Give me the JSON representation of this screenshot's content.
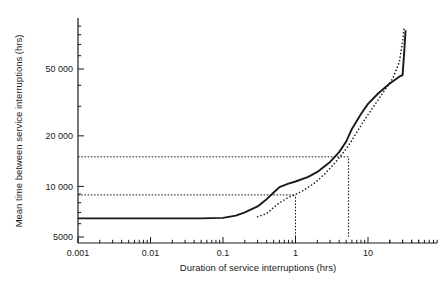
{
  "chart_data": {
    "type": "line",
    "title": "",
    "xlabel": "Duration of service interruptions (hrs)",
    "ylabel": "Mean time between service interruptions (hrs)",
    "xscale": "log",
    "yscale": "log",
    "xlim": [
      0.001,
      50
    ],
    "ylim": [
      5000,
      90000
    ],
    "xticks": [
      0.001,
      0.01,
      0.1,
      1,
      10
    ],
    "xticklabels": [
      "0.001",
      "0.01",
      "0.1",
      "1",
      "10"
    ],
    "yticks": [
      5000,
      10000,
      20000,
      50000
    ],
    "yticklabels": [
      "5000",
      "10 000",
      "20 000",
      "50 000"
    ],
    "grid": false,
    "legend": "none",
    "series": [
      {
        "name": "solid-curve",
        "style": "solid",
        "color": "#1a1a1a",
        "points": [
          [
            0.001,
            6450
          ],
          [
            0.01,
            6450
          ],
          [
            0.05,
            6450
          ],
          [
            0.1,
            6500
          ],
          [
            0.15,
            6700
          ],
          [
            0.2,
            7000
          ],
          [
            0.3,
            7600
          ],
          [
            0.4,
            8400
          ],
          [
            0.5,
            9200
          ],
          [
            0.6,
            9900
          ],
          [
            0.8,
            10400
          ],
          [
            1.0,
            10700
          ],
          [
            1.5,
            11400
          ],
          [
            2.0,
            12200
          ],
          [
            3.0,
            14000
          ],
          [
            4.0,
            16000
          ],
          [
            5.0,
            18500
          ],
          [
            6.0,
            22000
          ],
          [
            8.0,
            27000
          ],
          [
            10.0,
            31000
          ],
          [
            14.0,
            36000
          ],
          [
            20.0,
            41000
          ],
          [
            27.0,
            45000
          ],
          [
            30.0,
            46000
          ],
          [
            31.5,
            62000
          ],
          [
            33.0,
            85000
          ]
        ]
      },
      {
        "name": "dotted-curve",
        "style": "dotted",
        "color": "#1a1a1a",
        "points": [
          [
            0.3,
            6600
          ],
          [
            0.4,
            6900
          ],
          [
            0.5,
            7500
          ],
          [
            0.6,
            8000
          ],
          [
            0.8,
            8600
          ],
          [
            1.0,
            8950
          ],
          [
            1.3,
            9500
          ],
          [
            1.8,
            10400
          ],
          [
            2.5,
            11800
          ],
          [
            3.5,
            13800
          ],
          [
            4.5,
            15800
          ],
          [
            5.4,
            17500
          ],
          [
            7.0,
            21000
          ],
          [
            9.0,
            25000
          ],
          [
            12.0,
            30000
          ],
          [
            16.0,
            36000
          ],
          [
            22.0,
            44000
          ],
          [
            27.0,
            55000
          ],
          [
            30.0,
            72000
          ],
          [
            31.5,
            90000
          ]
        ]
      }
    ],
    "reference_lines": [
      {
        "name": "horizontal-reference-upper",
        "orientation": "horizontal",
        "y": 15000,
        "x_from": 0.001,
        "x_to": 5.4
      },
      {
        "name": "horizontal-reference-lower",
        "orientation": "horizontal",
        "y": 8900,
        "x_from": 0.001,
        "x_to": 1.0
      },
      {
        "name": "vertical-reference-left",
        "orientation": "vertical",
        "x": 1.0,
        "y_from": 5000,
        "y_to": 8900
      },
      {
        "name": "vertical-reference-right",
        "orientation": "vertical",
        "x": 5.4,
        "y_from": 5000,
        "y_to": 15000
      }
    ]
  }
}
